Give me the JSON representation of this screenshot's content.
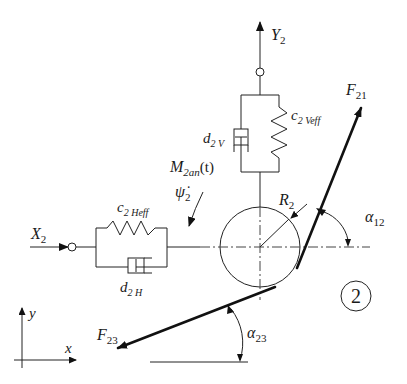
{
  "diagram": {
    "title": "",
    "body_number": "2",
    "labels": {
      "Y": {
        "main": "Y",
        "sub": "2"
      },
      "X": {
        "main": "X",
        "sub": "2"
      },
      "c_v": {
        "main": "c",
        "sub": "2 Veff"
      },
      "d_v": {
        "main": "d",
        "sub": "2 V"
      },
      "c_h": {
        "main": "c",
        "sub": "2 Heff"
      },
      "d_h": {
        "main": "d",
        "sub": "2 H"
      },
      "M": {
        "main": "M",
        "sub": "2an",
        "suffix": "(t)"
      },
      "psi": {
        "main": "ψ̇",
        "sub": "2"
      },
      "R": {
        "main": "R",
        "sub": "2"
      },
      "F21": {
        "main": "F",
        "sub": "21"
      },
      "F23": {
        "main": "F",
        "sub": "23"
      },
      "alpha12": {
        "main": "α",
        "sub": "12"
      },
      "alpha23": {
        "main": "α",
        "sub": "23"
      },
      "axis_x": "x",
      "axis_y": "y"
    }
  }
}
